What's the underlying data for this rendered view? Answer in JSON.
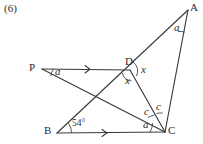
{
  "figure": {
    "question_number": "(6)",
    "stroke_color": "#3a3a3a",
    "text_color": "#2b2b2b",
    "background": "#ffffff",
    "vertices": [
      {
        "name": "A",
        "label": "A",
        "x": 188,
        "y": 10,
        "label_x": 190,
        "label_y": 2
      },
      {
        "name": "P",
        "label": "P",
        "x": 42,
        "y": 69,
        "label_x": 29,
        "label_y": 62
      },
      {
        "name": "D",
        "label": "D",
        "x": 130,
        "y": 70,
        "label_x": 125,
        "label_y": 57
      },
      {
        "name": "B",
        "label": "B",
        "x": 57,
        "y": 133,
        "label_x": 44,
        "label_y": 126
      },
      {
        "name": "C",
        "label": "C",
        "x": 165,
        "y": 132,
        "label_x": 168,
        "label_y": 126
      }
    ],
    "segments": [
      {
        "name": "segment-PD",
        "from": "P",
        "to": "D"
      },
      {
        "name": "segment-BC",
        "from": "B",
        "to": "C"
      },
      {
        "name": "segment-B-to-A",
        "from": "B",
        "to": "A"
      },
      {
        "name": "segment-P-to-C",
        "from": "P",
        "to": "C"
      },
      {
        "name": "segment-D-to-C",
        "from": "D",
        "to": "C"
      },
      {
        "name": "segment-A-to-C",
        "from": "A",
        "to": "C"
      }
    ],
    "parallel_marks": [
      {
        "name": "arrow-marker-PD",
        "x": 88,
        "y": 69
      },
      {
        "name": "arrow-marker-BC",
        "x": 105,
        "y": 133
      }
    ],
    "angle_labels": [
      {
        "name": "angle-label-at-A",
        "text": "a",
        "x": 174,
        "y": 27
      },
      {
        "name": "angle-label-at-P",
        "text": "a",
        "x": 55,
        "y": 71
      },
      {
        "name": "angle-label-at-D-right",
        "text": "x",
        "x": 141,
        "y": 69
      },
      {
        "name": "angle-label-at-D-below",
        "text": "x",
        "x": 126,
        "y": 80
      },
      {
        "name": "angle-label-at-B",
        "text": "54°",
        "x": 74,
        "y": 125
      },
      {
        "name": "angle-label-at-C-left",
        "text": "a",
        "x": 144,
        "y": 124
      },
      {
        "name": "angle-label-at-C-middle",
        "text": "c",
        "x": 145,
        "y": 112
      },
      {
        "name": "angle-label-at-C-right",
        "text": "c",
        "x": 157,
        "y": 108
      }
    ]
  }
}
